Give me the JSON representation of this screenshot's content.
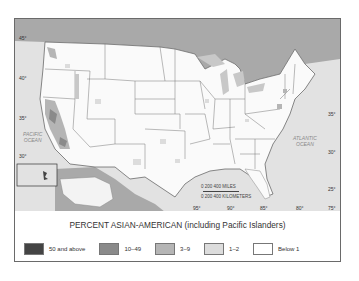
{
  "map": {
    "latitude_labels_left": [
      "45°",
      "40°",
      "35°",
      "30°"
    ],
    "latitude_labels_right": [
      "35°",
      "30°",
      "25°"
    ],
    "longitude_labels": [
      "95°",
      "90°",
      "85°",
      "80°",
      "75°"
    ],
    "oceans": {
      "pacific": "PACIFIC\nOCEAN",
      "atlantic": "ATLANTIC\nOCEAN"
    },
    "scale": {
      "miles_label": "0    200    400 MILES",
      "km_label": "0  200  400 KILOMETERS"
    },
    "colors": {
      "ocean": "#e2e2e2",
      "land": "#fafafa",
      "foreign_land": "#a9a9a9",
      "border": "#6a6a6a"
    }
  },
  "legend": {
    "title": "PERCENT ASIAN-AMERICAN (including Pacific Islanders)",
    "items": [
      {
        "label": "50 and above",
        "color": "#444444"
      },
      {
        "label": "10–49",
        "color": "#8a8a8a"
      },
      {
        "label": "3–9",
        "color": "#b5b5b5"
      },
      {
        "label": "1–2",
        "color": "#dcdcdc"
      },
      {
        "label": "Below 1",
        "color": "#ffffff"
      }
    ]
  }
}
